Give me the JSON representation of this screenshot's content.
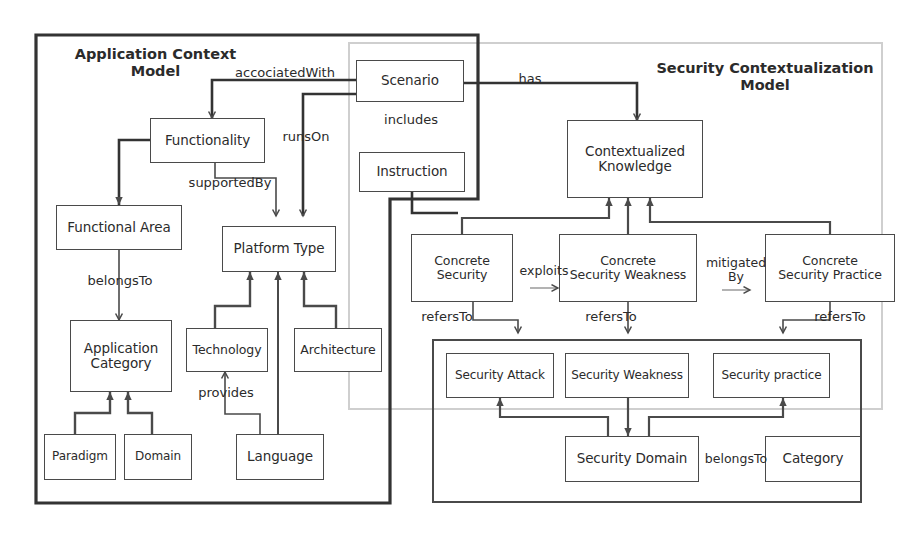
{
  "diagram": {
    "title_visible": false,
    "containers": [
      {
        "id": "application-context-model",
        "label": "Application Context\nModel",
        "style": "thick-black-notched"
      },
      {
        "id": "security-contextualization-model",
        "label": "Security Contextualization\nModel",
        "style": "thin-gray"
      },
      {
        "id": "security-knowledge-container",
        "label": "",
        "style": "thick-black"
      }
    ],
    "nodes": [
      {
        "id": "functionality",
        "label": "Functionality"
      },
      {
        "id": "functional-area",
        "label": "Functional Area"
      },
      {
        "id": "application-category",
        "label": "Application\nCategory"
      },
      {
        "id": "paradigm",
        "label": "Paradigm"
      },
      {
        "id": "domain",
        "label": "Domain"
      },
      {
        "id": "platform-type",
        "label": "Platform Type"
      },
      {
        "id": "technology",
        "label": "Technology"
      },
      {
        "id": "architecture",
        "label": "Architecture"
      },
      {
        "id": "language",
        "label": "Language"
      },
      {
        "id": "scenario",
        "label": "Scenario"
      },
      {
        "id": "instruction",
        "label": "Instruction"
      },
      {
        "id": "contextualized-knowledge",
        "label": "Contextualized\nKnowledge"
      },
      {
        "id": "concrete-security",
        "label": "Concrete\nSecurity"
      },
      {
        "id": "concrete-security-weakness",
        "label": "Concrete\nSecurity Weakness"
      },
      {
        "id": "concrete-security-practice",
        "label": "Concrete\nSecurity Practice"
      },
      {
        "id": "security-attack",
        "label": "Security Attack"
      },
      {
        "id": "security-weakness",
        "label": "Security Weakness"
      },
      {
        "id": "security-practice",
        "label": "Security practice"
      },
      {
        "id": "security-domain",
        "label": "Security Domain"
      },
      {
        "id": "category",
        "label": "Category"
      }
    ],
    "edge_labels": [
      {
        "id": "accociated-with",
        "text": "accociatedWith"
      },
      {
        "id": "runs-on",
        "text": "runsOn"
      },
      {
        "id": "includes",
        "text": "includes"
      },
      {
        "id": "has",
        "text": "has"
      },
      {
        "id": "supported-by",
        "text": "supportedBy"
      },
      {
        "id": "belongs-to-fa",
        "text": "belongsTo"
      },
      {
        "id": "provides",
        "text": "provides"
      },
      {
        "id": "exploits",
        "text": "exploits"
      },
      {
        "id": "mitigated-by",
        "text": "mitigated\nBy"
      },
      {
        "id": "refers-to-left",
        "text": "refersTo"
      },
      {
        "id": "refers-to-mid",
        "text": "refersTo"
      },
      {
        "id": "refers-to-right",
        "text": "refersTo"
      },
      {
        "id": "belongs-to-sd",
        "text": "belongsTo"
      }
    ],
    "colors": {
      "box_border": "#4a4a4a",
      "container_black": "#333333",
      "container_gray": "#cfcfcf",
      "text": "#2b2b2b",
      "background": "#ffffff"
    }
  }
}
